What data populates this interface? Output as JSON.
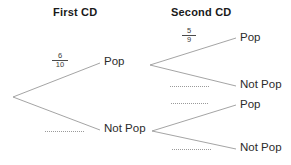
{
  "diagram": {
    "type": "probability-tree",
    "title_columns": {
      "first": "First CD",
      "second": "Second CD"
    },
    "root": {
      "label": ""
    },
    "level1": {
      "branches": [
        {
          "node": "Pop",
          "probability": {
            "numerator": "6",
            "denominator": "10"
          },
          "shown": true
        },
        {
          "node": "Not Pop",
          "probability": null,
          "placeholder": "dotted-line",
          "shown": false
        }
      ]
    },
    "level2": {
      "from_pop": [
        {
          "node": "Pop",
          "probability": {
            "numerator": "5",
            "denominator": "9"
          },
          "shown": true
        },
        {
          "node": "Not Pop",
          "probability": null,
          "placeholder": "dotted-line",
          "shown": false
        }
      ],
      "from_not_pop": [
        {
          "node": "Pop",
          "probability": null,
          "placeholder": "dotted-line",
          "shown": false
        },
        {
          "node": "Not Pop",
          "probability": null,
          "placeholder": "dotted-line",
          "shown": false
        }
      ]
    },
    "colors": {
      "background": "#ffffff",
      "branch_line": "#9a9a9a",
      "header_text": "#1a1a1a",
      "label_text": "#2b2b2b",
      "fraction_text": "#3a3a3a",
      "placeholder_dots": "#9a9a9a"
    }
  }
}
